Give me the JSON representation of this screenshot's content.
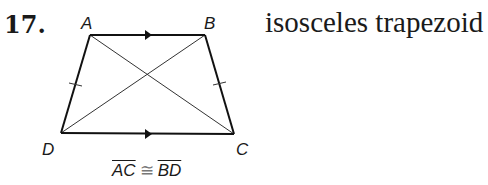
{
  "problem": {
    "number": "17.",
    "description": "isosceles trapezoid"
  },
  "figure": {
    "vertices": [
      {
        "label": "A",
        "x": 90,
        "y": 35
      },
      {
        "label": "B",
        "x": 205,
        "y": 35
      },
      {
        "label": "C",
        "x": 234,
        "y": 134
      },
      {
        "label": "D",
        "x": 61,
        "y": 133
      }
    ],
    "parallel_sides": [
      "AB",
      "DC"
    ],
    "congruent_legs": [
      "AD",
      "BC"
    ],
    "diagonals": [
      "AC",
      "BD"
    ]
  },
  "caption": {
    "seg1": "AC",
    "symbol": "≅",
    "seg2": "BD"
  }
}
